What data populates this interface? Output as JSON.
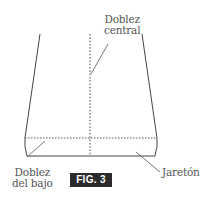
{
  "figure": {
    "badge": "FIG. 3",
    "labels": {
      "center_fold": {
        "line1": "Doblez",
        "line2": "central"
      },
      "hem_fold": {
        "line1": "Doblez",
        "line2": "del bajo"
      },
      "hem": {
        "text": "Jaretón"
      }
    }
  },
  "colors": {
    "outline": "#444444",
    "badge_bg": "#2b2b2b",
    "badge_text": "#ffffff",
    "label_text": "#555555"
  }
}
